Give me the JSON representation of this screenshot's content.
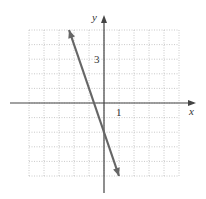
{
  "chart_data": {
    "type": "line",
    "title": "",
    "xlabel": "x",
    "ylabel": "y",
    "xlim": [
      -5,
      5
    ],
    "ylim": [
      -5,
      5
    ],
    "grid": true,
    "tick_labels": {
      "x": [
        "1"
      ],
      "y": [
        "3"
      ]
    },
    "series": [
      {
        "name": "y = -3x - 2",
        "x": [
          -2.33,
          1
        ],
        "y": [
          5,
          -5
        ]
      }
    ],
    "line_color": "#666666"
  }
}
